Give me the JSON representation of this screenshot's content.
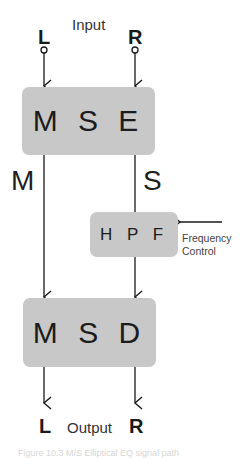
{
  "diagram": {
    "input_label": "Input",
    "output_label": "Output",
    "inputs": {
      "left": "L",
      "right": "R"
    },
    "outputs": {
      "left": "L",
      "right": "R"
    },
    "signals": {
      "mid": "M",
      "side": "S"
    },
    "blocks": {
      "encoder": "M S E",
      "filter": "H P F",
      "decoder": "M S D"
    },
    "control": {
      "line1": "Frequency",
      "line2": "Control"
    },
    "caption": "Figure 10.3 M/S Elliptical EQ signal path"
  },
  "colors": {
    "block_fill": "#c8c8c8",
    "line": "#1a1a1a",
    "background": "#ffffff"
  }
}
